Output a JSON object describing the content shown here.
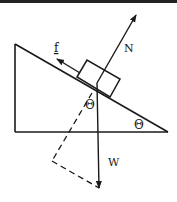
{
  "diagram": {
    "colors": {
      "line": "#1a1a1a",
      "background": "#ffffff",
      "border": "#222222"
    },
    "labels": {
      "normal_force": "N",
      "friction": "f",
      "weight": "W",
      "angle_at_block": "Θ",
      "angle_at_incline": "Θ"
    }
  }
}
